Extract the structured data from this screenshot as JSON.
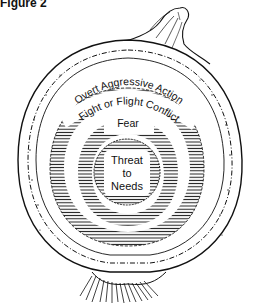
{
  "figure": {
    "label": "Figure 2"
  },
  "layers": [
    {
      "order": 1,
      "label": "Overt Aggressive Action",
      "pattern": "stippled-skin"
    },
    {
      "order": 2,
      "label": "Fight or Flight Conflict",
      "pattern": "hatched"
    },
    {
      "order": 3,
      "label": "Fear",
      "pattern": "hatched"
    },
    {
      "order": 4,
      "label": "Threat to Needs",
      "pattern": "hatched"
    }
  ],
  "center": {
    "line1": "Threat",
    "line2": "to",
    "line3": "Needs"
  },
  "colors": {
    "ink": "#111111",
    "paper": "#ffffff"
  }
}
